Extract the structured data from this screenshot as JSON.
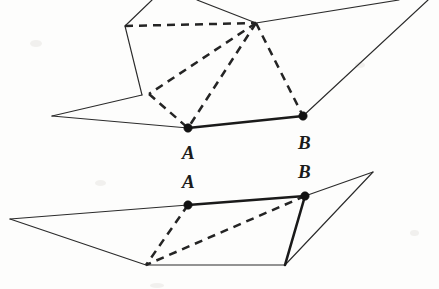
{
  "figure": {
    "background_color": "#fdfdfc",
    "ink_color": "#2b2b2b",
    "width": 439,
    "height": 289,
    "labels": [
      {
        "id": "label-a-upper",
        "text": "A",
        "x": 182,
        "y": 143,
        "belongs_to": "upper-figure"
      },
      {
        "id": "label-b-upper",
        "text": "B",
        "x": 298,
        "y": 133,
        "belongs_to": "upper-figure"
      },
      {
        "id": "label-a-lower",
        "text": "A",
        "x": 182,
        "y": 172,
        "belongs_to": "lower-figure"
      },
      {
        "id": "label-b-lower",
        "text": "B",
        "x": 298,
        "y": 162,
        "belongs_to": "lower-figure"
      }
    ],
    "upper_figure": {
      "name": "folded-polyhedron-upper",
      "points": {
        "A": [
          188,
          128
        ],
        "B": [
          303,
          116
        ],
        "apex": [
          256,
          23
        ],
        "left_fold": [
          125,
          26
        ],
        "left_mid": [
          142,
          95
        ],
        "dashed_corner": [
          149,
          94
        ],
        "far_left": [
          52,
          116
        ],
        "top_left_out": [
          152,
          0
        ],
        "top_mid_out": [
          197,
          0
        ],
        "top_right_out": [
          399,
          0
        ],
        "right_out": [
          428,
          0
        ]
      },
      "solid_edges": [
        {
          "name": "edge-left-upper-out",
          "path": "152,0 125,26"
        },
        {
          "name": "edge-left-down",
          "path": "125,26 142,95"
        },
        {
          "name": "edge-left-to-farleft",
          "path": "142,95 52,116"
        },
        {
          "name": "edge-farleft-to-a",
          "path": "52,116 188,128"
        },
        {
          "name": "edge-top-mid-to-apex",
          "path": "197,0 256,23"
        },
        {
          "name": "edge-apex-to-top-right",
          "path": "256,23 399,0"
        },
        {
          "name": "edge-right-out-to-b",
          "path": "428,0 303,116"
        }
      ],
      "bold_edges": [
        {
          "name": "segment-ab-upper",
          "path": "188,128 303,116"
        }
      ],
      "dashed_edges": [
        {
          "name": "dashed-fold-top",
          "path": "125,26 256,23"
        },
        {
          "name": "dashed-apex-to-corner",
          "path": "256,23 149,94"
        },
        {
          "name": "dashed-apex-to-a",
          "path": "256,23 188,128"
        },
        {
          "name": "dashed-apex-to-b",
          "path": "256,23 303,116"
        },
        {
          "name": "dashed-corner-to-a",
          "path": "149,94 188,128"
        }
      ],
      "vertex_dots": [
        {
          "name": "dot-a-upper",
          "x": 188,
          "y": 128,
          "r": 4.2
        },
        {
          "name": "dot-b-upper",
          "x": 303,
          "y": 116,
          "r": 4.2
        }
      ]
    },
    "lower_figure": {
      "name": "unfolded-polyhedron-lower",
      "points": {
        "A": [
          188,
          205
        ],
        "B": [
          305,
          196
        ],
        "far_left": [
          10,
          219
        ],
        "bottom_left": [
          146,
          265
        ],
        "bottom_right": [
          285,
          265
        ],
        "far_right": [
          373,
          172
        ]
      },
      "solid_edges": [
        {
          "name": "edge-farleft-to-a-lower",
          "path": "10,219 188,205"
        },
        {
          "name": "edge-farleft-to-bottomleft",
          "path": "10,219 146,265"
        },
        {
          "name": "edge-bottom",
          "path": "146,265 285,265"
        },
        {
          "name": "edge-b-to-farright",
          "path": "305,196 373,172"
        },
        {
          "name": "edge-farright-to-bottomright",
          "path": "373,172 285,265"
        }
      ],
      "bold_edges": [
        {
          "name": "segment-ab-lower",
          "path": "188,205 305,196"
        },
        {
          "name": "edge-b-to-bottomright",
          "path": "305,196 285,265"
        }
      ],
      "dashed_edges": [
        {
          "name": "dashed-a-to-bottomleft",
          "path": "188,205 146,265"
        },
        {
          "name": "dashed-b-to-bottomleft",
          "path": "305,196 146,265"
        }
      ],
      "vertex_dots": [
        {
          "name": "dot-a-lower",
          "x": 188,
          "y": 205,
          "r": 4.2
        },
        {
          "name": "dot-b-lower",
          "x": 305,
          "y": 196,
          "r": 4.2
        }
      ]
    }
  }
}
